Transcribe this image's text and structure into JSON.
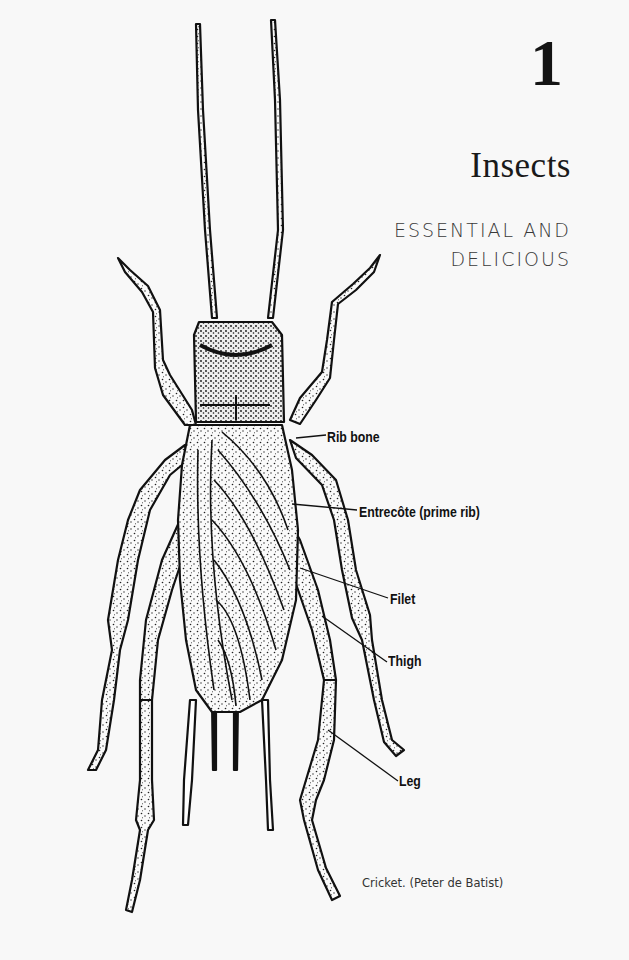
{
  "chapter": {
    "number": "1",
    "title": "Insects",
    "subtitle_lines": [
      "ESSENTIAL AND",
      "DELICIOUS"
    ]
  },
  "illustration": {
    "subject": "cricket-line-drawing",
    "labels": [
      {
        "text": "Rib bone",
        "x": 327,
        "y": 428
      },
      {
        "text": "Entrecôte (prime rib)",
        "x": 359,
        "y": 505
      },
      {
        "text": "Filet",
        "x": 390,
        "y": 590
      },
      {
        "text": "Thigh",
        "x": 388,
        "y": 652
      },
      {
        "text": "Leg",
        "x": 399,
        "y": 772
      }
    ],
    "caption": "Cricket. (Peter de Batist)"
  },
  "colors": {
    "background": "#f8f8f8",
    "ink": "#111111",
    "subtitle": "#3a3a3a"
  }
}
